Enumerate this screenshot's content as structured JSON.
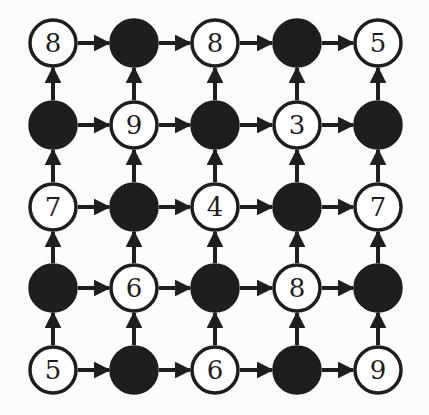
{
  "diagram": {
    "type": "grid-graph",
    "rows": 5,
    "cols": 5,
    "colors": {
      "stroke": "#1e1e1e",
      "filled": "#1e1e1e",
      "empty": "#ffffff",
      "background": "#fcfcfc"
    },
    "col_x": [
      53,
      134,
      215,
      297,
      378
    ],
    "row_y": [
      43,
      125,
      207,
      288,
      370
    ],
    "radius": 23,
    "nodes": [
      [
        {
          "filled": false,
          "label": "8"
        },
        {
          "filled": true,
          "label": ""
        },
        {
          "filled": false,
          "label": "8"
        },
        {
          "filled": true,
          "label": ""
        },
        {
          "filled": false,
          "label": "5"
        }
      ],
      [
        {
          "filled": true,
          "label": ""
        },
        {
          "filled": false,
          "label": "9"
        },
        {
          "filled": true,
          "label": ""
        },
        {
          "filled": false,
          "label": "3"
        },
        {
          "filled": true,
          "label": ""
        }
      ],
      [
        {
          "filled": false,
          "label": "7"
        },
        {
          "filled": true,
          "label": ""
        },
        {
          "filled": false,
          "label": "4"
        },
        {
          "filled": true,
          "label": ""
        },
        {
          "filled": false,
          "label": "7"
        }
      ],
      [
        {
          "filled": true,
          "label": ""
        },
        {
          "filled": false,
          "label": "6"
        },
        {
          "filled": true,
          "label": ""
        },
        {
          "filled": false,
          "label": "8"
        },
        {
          "filled": true,
          "label": ""
        }
      ],
      [
        {
          "filled": false,
          "label": "5"
        },
        {
          "filled": true,
          "label": ""
        },
        {
          "filled": false,
          "label": "6"
        },
        {
          "filled": true,
          "label": ""
        },
        {
          "filled": false,
          "label": "9"
        }
      ]
    ],
    "edges": {
      "horizontal": "every node points right to its neighbor in the same row",
      "vertical": "every node points up to its neighbor in the same column"
    }
  }
}
